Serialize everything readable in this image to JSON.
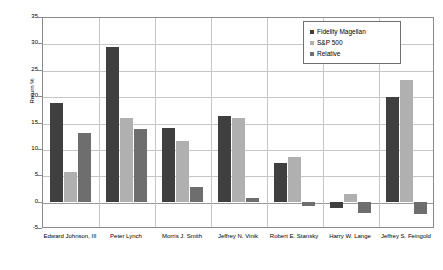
{
  "chart_data": {
    "type": "bar",
    "title": "",
    "xlabel": "",
    "ylabel": "Return %",
    "ylim": [
      -5,
      35
    ],
    "ytick_step": 5,
    "yticks": [
      "35",
      "30",
      "25",
      "20",
      "15",
      "10",
      "5",
      "0",
      "-5"
    ],
    "grid": true,
    "legend_position": "top-right",
    "categories": [
      "Edward Johnson, III",
      "Peter Lynch",
      "Morris J. Smith",
      "Jeffrey N. Vinik",
      "Robert E. Stansky",
      "Harry W. Lange",
      "Jeffrey S. Feingold"
    ],
    "series": [
      {
        "name": "Fidelity Magellan",
        "color": "#3f3f3f",
        "values": [
          18.7,
          29.4,
          14.0,
          16.2,
          7.4,
          -1.2,
          19.9
        ]
      },
      {
        "name": "S&P 500",
        "color": "#b0b0b0",
        "values": [
          5.7,
          15.8,
          11.4,
          15.8,
          8.5,
          1.5,
          23.0
        ]
      },
      {
        "name": "Relative",
        "color": "#6e6e6e",
        "values": [
          13.0,
          13.7,
          2.8,
          0.6,
          -0.8,
          -2.2,
          -2.4
        ]
      }
    ]
  },
  "legend": {
    "items": [
      {
        "label": "Fidelity Magellan"
      },
      {
        "label": "S&P 500"
      },
      {
        "label": "Relative"
      }
    ]
  },
  "axis": {
    "y_title": "Return %"
  }
}
